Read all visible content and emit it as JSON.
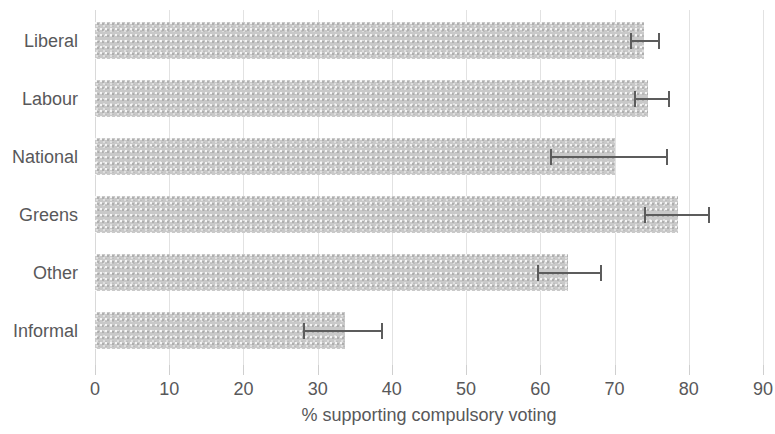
{
  "chart_data": {
    "type": "bar",
    "orientation": "horizontal",
    "title": "",
    "subtitle": "",
    "xlabel": "% supporting compulsory voting",
    "ylabel": "",
    "categories": [
      "Liberal",
      "Labour",
      "National",
      "Greens",
      "Other",
      "Informal"
    ],
    "values": [
      74.0,
      74.5,
      70.0,
      78.6,
      63.7,
      33.7
    ],
    "error_low": [
      72.1,
      72.6,
      61.3,
      74.0,
      59.6,
      28.0
    ],
    "error_high": [
      76.1,
      77.5,
      77.2,
      82.9,
      68.3,
      38.8
    ],
    "series": [
      {
        "name": "% supporting compulsory voting",
        "values": [
          74.0,
          74.5,
          70.0,
          78.6,
          63.7,
          33.7
        ]
      }
    ],
    "xlim": [
      0,
      90
    ],
    "xticks": [
      0,
      10,
      20,
      30,
      40,
      50,
      60,
      70,
      80,
      90
    ],
    "xtick_labels": [
      "0",
      "10",
      "20",
      "30",
      "40",
      "50",
      "60",
      "70",
      "80",
      "90"
    ],
    "ytick_labels": [
      "Liberal",
      "Labour",
      "National",
      "Greens",
      "Other",
      "Informal"
    ],
    "grid": "vertical",
    "legend": "none",
    "bar_color": "#c9c9c9",
    "errorbar_color": "#5c5c5c",
    "gridline_color": "#e2e2e2",
    "text_color": "#58585a",
    "background_color": "#ffffff",
    "annotations": []
  }
}
